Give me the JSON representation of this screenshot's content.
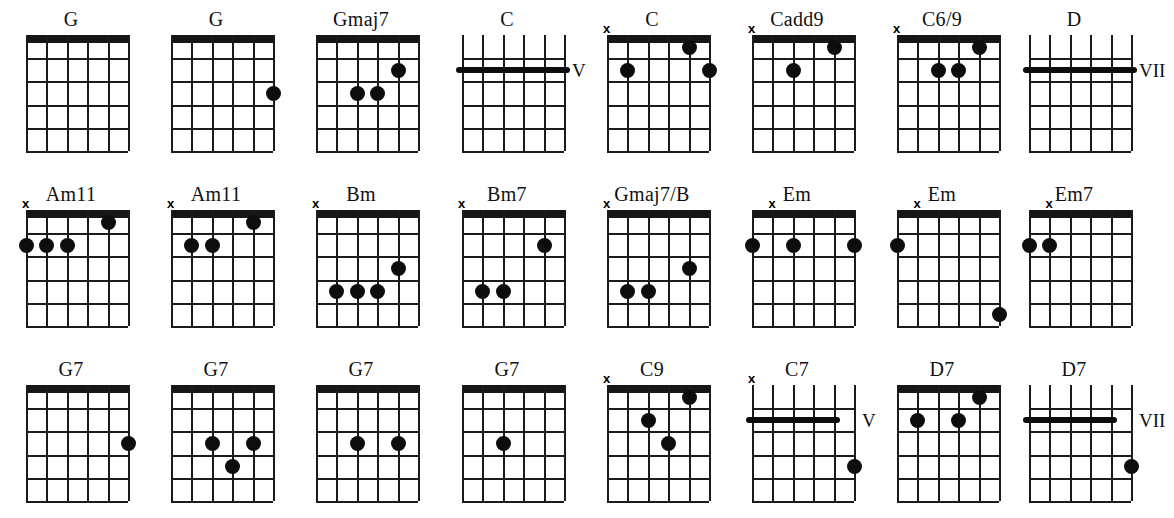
{
  "sheet": {
    "title": "Guitar Chord Diagram Sheet",
    "columns": 8,
    "rows": 3,
    "strings": 6,
    "frets": 5,
    "ink_color": "#0d0d0d",
    "background_color": "#ffffff",
    "mute_symbol": "x"
  },
  "chart_data": {
    "type": "table",
    "xlabel": "strings (6 low E to 1 high E)",
    "ylabel": "frets",
    "grid": true,
    "legend": "none",
    "categories": [
      "G",
      "G",
      "Gmaj7",
      "C",
      "C",
      "Cadd9",
      "C6/9",
      "D",
      "Am11",
      "Am11",
      "Bm",
      "Bm7",
      "Gmaj7/B",
      "Em",
      "Em",
      "Em7",
      "G7",
      "G7",
      "G7",
      "G7",
      "C9",
      "C7",
      "D7",
      "D7"
    ],
    "values": [
      0,
      1,
      3,
      1,
      3,
      2,
      3,
      1,
      4,
      3,
      4,
      3,
      3,
      3,
      2,
      2,
      1,
      3,
      2,
      1,
      3,
      2,
      3,
      2
    ]
  },
  "chords": [
    {
      "name": "G",
      "row": 0,
      "col": 0,
      "open_nut": false,
      "mute": null,
      "position_label": null,
      "dots": [],
      "barres": []
    },
    {
      "name": "G",
      "row": 0,
      "col": 1,
      "open_nut": false,
      "mute": null,
      "position_label": null,
      "dots": [
        {
          "string": 1,
          "fret": 3
        }
      ],
      "barres": []
    },
    {
      "name": "Gmaj7",
      "row": 0,
      "col": 2,
      "open_nut": false,
      "mute": null,
      "position_label": null,
      "dots": [
        {
          "string": 4,
          "fret": 3
        },
        {
          "string": 3,
          "fret": 3
        },
        {
          "string": 2,
          "fret": 2
        }
      ],
      "barres": []
    },
    {
      "name": "C",
      "row": 0,
      "col": 3,
      "open_nut": true,
      "mute": null,
      "position_label": "V",
      "dots": [],
      "barres": [
        {
          "fret": 2,
          "from_string": 6,
          "to_string": 1
        }
      ]
    },
    {
      "name": "C",
      "row": 0,
      "col": 4,
      "open_nut": false,
      "mute": 6,
      "position_label": null,
      "dots": [
        {
          "string": 5,
          "fret": 2
        },
        {
          "string": 2,
          "fret": 1
        },
        {
          "string": 1,
          "fret": 2
        }
      ],
      "barres": []
    },
    {
      "name": "Cadd9",
      "row": 0,
      "col": 5,
      "open_nut": false,
      "mute": 6,
      "position_label": null,
      "dots": [
        {
          "string": 4,
          "fret": 2
        },
        {
          "string": 2,
          "fret": 1
        }
      ],
      "barres": []
    },
    {
      "name": "C6/9",
      "row": 0,
      "col": 6,
      "open_nut": false,
      "mute": 6,
      "position_label": null,
      "dots": [
        {
          "string": 4,
          "fret": 2
        },
        {
          "string": 3,
          "fret": 2
        },
        {
          "string": 2,
          "fret": 1
        }
      ],
      "barres": []
    },
    {
      "name": "D",
      "row": 0,
      "col": 7,
      "open_nut": true,
      "mute": null,
      "position_label": "VII",
      "dots": [],
      "barres": [
        {
          "fret": 2,
          "from_string": 6,
          "to_string": 1
        }
      ]
    },
    {
      "name": "Am11",
      "row": 1,
      "col": 0,
      "open_nut": false,
      "mute": 6,
      "position_label": null,
      "dots": [
        {
          "string": 6,
          "fret": 2
        },
        {
          "string": 5,
          "fret": 2
        },
        {
          "string": 4,
          "fret": 2
        },
        {
          "string": 2,
          "fret": 1
        }
      ],
      "barres": []
    },
    {
      "name": "Am11",
      "row": 1,
      "col": 1,
      "open_nut": false,
      "mute": 6,
      "position_label": null,
      "dots": [
        {
          "string": 5,
          "fret": 2
        },
        {
          "string": 4,
          "fret": 2
        },
        {
          "string": 2,
          "fret": 1
        }
      ],
      "barres": []
    },
    {
      "name": "Bm",
      "row": 1,
      "col": 2,
      "open_nut": false,
      "mute": 6,
      "position_label": null,
      "dots": [
        {
          "string": 5,
          "fret": 4
        },
        {
          "string": 4,
          "fret": 4
        },
        {
          "string": 3,
          "fret": 4
        },
        {
          "string": 2,
          "fret": 3
        }
      ],
      "barres": []
    },
    {
      "name": "Bm7",
      "row": 1,
      "col": 3,
      "open_nut": false,
      "mute": 6,
      "position_label": null,
      "dots": [
        {
          "string": 5,
          "fret": 4
        },
        {
          "string": 4,
          "fret": 4
        },
        {
          "string": 2,
          "fret": 2
        }
      ],
      "barres": []
    },
    {
      "name": "Gmaj7/B",
      "row": 1,
      "col": 4,
      "open_nut": false,
      "mute": 6,
      "position_label": null,
      "dots": [
        {
          "string": 5,
          "fret": 4
        },
        {
          "string": 4,
          "fret": 4
        },
        {
          "string": 2,
          "fret": 3
        }
      ],
      "barres": []
    },
    {
      "name": "Em",
      "row": 1,
      "col": 5,
      "open_nut": false,
      "mute": 5,
      "position_label": null,
      "dots": [
        {
          "string": 6,
          "fret": 2
        },
        {
          "string": 4,
          "fret": 2
        },
        {
          "string": 1,
          "fret": 2
        }
      ],
      "barres": []
    },
    {
      "name": "Em",
      "row": 1,
      "col": 6,
      "open_nut": false,
      "mute": 5,
      "position_label": null,
      "dots": [
        {
          "string": 6,
          "fret": 2
        },
        {
          "string": 1,
          "fret": 5
        }
      ],
      "barres": []
    },
    {
      "name": "Em7",
      "row": 1,
      "col": 7,
      "open_nut": false,
      "mute": 5,
      "position_label": null,
      "dots": [
        {
          "string": 6,
          "fret": 2
        },
        {
          "string": 5,
          "fret": 2
        }
      ],
      "barres": []
    },
    {
      "name": "G7",
      "row": 2,
      "col": 0,
      "open_nut": false,
      "mute": null,
      "position_label": null,
      "dots": [
        {
          "string": 1,
          "fret": 3
        }
      ],
      "barres": []
    },
    {
      "name": "G7",
      "row": 2,
      "col": 1,
      "open_nut": false,
      "mute": null,
      "position_label": null,
      "dots": [
        {
          "string": 4,
          "fret": 3
        },
        {
          "string": 3,
          "fret": 4
        },
        {
          "string": 2,
          "fret": 3
        }
      ],
      "barres": []
    },
    {
      "name": "G7",
      "row": 2,
      "col": 2,
      "open_nut": false,
      "mute": null,
      "position_label": null,
      "dots": [
        {
          "string": 4,
          "fret": 3
        },
        {
          "string": 2,
          "fret": 3
        }
      ],
      "barres": []
    },
    {
      "name": "G7",
      "row": 2,
      "col": 3,
      "open_nut": false,
      "mute": null,
      "position_label": null,
      "dots": [
        {
          "string": 4,
          "fret": 3
        }
      ],
      "barres": []
    },
    {
      "name": "C9",
      "row": 2,
      "col": 4,
      "open_nut": false,
      "mute": 6,
      "position_label": null,
      "dots": [
        {
          "string": 4,
          "fret": 2
        },
        {
          "string": 3,
          "fret": 3
        },
        {
          "string": 2,
          "fret": 1
        }
      ],
      "barres": []
    },
    {
      "name": "C7",
      "row": 2,
      "col": 5,
      "open_nut": true,
      "mute": 6,
      "position_label": "V",
      "dots": [
        {
          "string": 1,
          "fret": 4
        }
      ],
      "barres": [
        {
          "fret": 2,
          "from_string": 6,
          "to_string": 2
        }
      ]
    },
    {
      "name": "D7",
      "row": 2,
      "col": 6,
      "open_nut": false,
      "mute": null,
      "position_label": null,
      "dots": [
        {
          "string": 5,
          "fret": 2
        },
        {
          "string": 3,
          "fret": 2
        },
        {
          "string": 2,
          "fret": 1
        }
      ],
      "barres": []
    },
    {
      "name": "D7",
      "row": 2,
      "col": 7,
      "open_nut": true,
      "mute": null,
      "position_label": "VII",
      "dots": [
        {
          "string": 1,
          "fret": 4
        }
      ],
      "barres": [
        {
          "fret": 2,
          "from_string": 6,
          "to_string": 2
        }
      ]
    }
  ]
}
